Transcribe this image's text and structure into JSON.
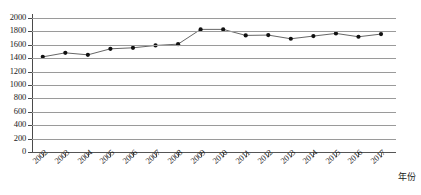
{
  "chart_data": {
    "type": "line",
    "title": "",
    "xlabel": "年份",
    "ylabel": "",
    "categories": [
      "2002",
      "2003",
      "2004",
      "2005",
      "2006",
      "2007",
      "2008",
      "2009",
      "2010",
      "2011",
      "2012",
      "2013",
      "2014",
      "2015",
      "2016",
      "2017"
    ],
    "values": [
      1420,
      1480,
      1450,
      1540,
      1555,
      1590,
      1610,
      1830,
      1830,
      1740,
      1745,
      1690,
      1730,
      1770,
      1720,
      1760
    ],
    "series": [
      {
        "name": "",
        "values": [
          1420,
          1480,
          1450,
          1540,
          1555,
          1590,
          1610,
          1830,
          1830,
          1740,
          1745,
          1690,
          1730,
          1770,
          1720,
          1760
        ]
      }
    ],
    "ylim": [
      0,
      2000
    ],
    "ytick_labels": [
      "2000",
      "1800",
      "1600",
      "1400",
      "1200",
      "1000",
      "800",
      "600",
      "400",
      "200",
      "0"
    ],
    "ytick_values": [
      2000,
      1800,
      1600,
      1400,
      1200,
      1000,
      800,
      600,
      400,
      200,
      0
    ],
    "grid": true,
    "legend": false,
    "legend_position": "none",
    "marker": "filled-circle",
    "line_color": "#555555",
    "marker_color": "#111111",
    "grid_color": "#9a9a9a",
    "axis_color": "#4a4a4a"
  }
}
